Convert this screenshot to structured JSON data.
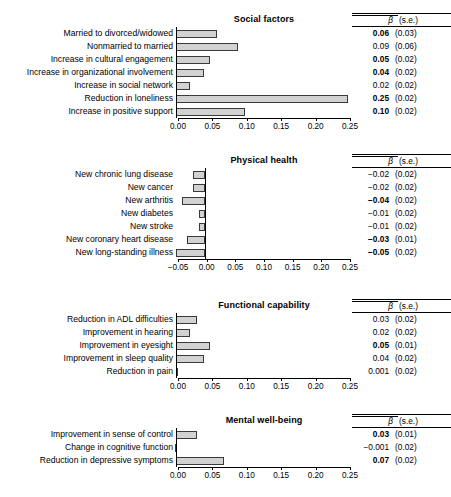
{
  "stats_header": {
    "beta": "β",
    "se": "(s.e.)"
  },
  "chart_data": {
    "type": "bar",
    "title": "",
    "xlabel": "",
    "ylabel": "",
    "grid": false,
    "orientation": "horizontal",
    "panels": [
      {
        "title": "Social factors",
        "xlim": [
          0.0,
          0.25
        ],
        "xticks": [
          0.0,
          0.05,
          0.1,
          0.15,
          0.2,
          0.25
        ],
        "xticklabels": [
          "0.00",
          "0.05",
          "0.10",
          "0.15",
          "0.20",
          "0.25"
        ],
        "categories": [
          "Married to divorced/widowed",
          "Nonmarried to married",
          "Increase in cultural engagement",
          "Increase in organizational involvement",
          "Increase in social network",
          "Reduction in loneliness",
          "Increase in positive support"
        ],
        "values": [
          0.06,
          0.09,
          0.05,
          0.04,
          0.02,
          0.25,
          0.1
        ],
        "beta": [
          "0.06",
          "0.09",
          "0.05",
          "0.04",
          "0.02",
          "0.25",
          "0.10"
        ],
        "beta_bold": [
          true,
          false,
          true,
          true,
          false,
          true,
          true
        ],
        "se": [
          "(0.03)",
          "(0.06)",
          "(0.02)",
          "(0.02)",
          "(0.02)",
          "(0.02)",
          "(0.02)"
        ]
      },
      {
        "title": "Physical health",
        "xlim": [
          -0.05,
          0.25
        ],
        "xticks": [
          -0.05,
          0.0,
          0.05,
          0.1,
          0.15,
          0.2,
          0.25
        ],
        "xticklabels": [
          "−0.05",
          "0.00",
          "0.05",
          "0.10",
          "0.15",
          "0.20",
          "0.25"
        ],
        "categories": [
          "New chronic lung disease",
          "New cancer",
          "New arthritis",
          "New diabetes",
          "New stroke",
          "New coronary heart disease",
          "New long-standing illness"
        ],
        "values": [
          -0.02,
          -0.02,
          -0.04,
          -0.01,
          -0.01,
          -0.03,
          -0.05
        ],
        "beta": [
          "−0.02",
          "−0.02",
          "−0.04",
          "−0.01",
          "−0.01",
          "−0.03",
          "−0.05"
        ],
        "beta_bold": [
          false,
          false,
          true,
          false,
          false,
          true,
          true
        ],
        "se": [
          "(0.02)",
          "(0.02)",
          "(0.02)",
          "(0.02)",
          "(0.02)",
          "(0.01)",
          "(0.02)"
        ]
      },
      {
        "title": "Functional capability",
        "xlim": [
          0.0,
          0.25
        ],
        "xticks": [
          0.0,
          0.05,
          0.1,
          0.15,
          0.2,
          0.25
        ],
        "xticklabels": [
          "0.00",
          "0.05",
          "0.10",
          "0.15",
          "0.20",
          "0.25"
        ],
        "categories": [
          "Reduction in ADL difficulties",
          "Improvement in hearing",
          "Improvement in eyesight",
          "Improvement in sleep quality",
          "Reduction in  pain"
        ],
        "values": [
          0.03,
          0.02,
          0.05,
          0.04,
          0.001
        ],
        "beta": [
          "0.03",
          "0.02",
          "0.05",
          "0.04",
          "0.001"
        ],
        "beta_bold": [
          false,
          false,
          true,
          false,
          false
        ],
        "se": [
          "(0.02)",
          "(0.02)",
          "(0.01)",
          "(0.02)",
          "(0.02)"
        ]
      },
      {
        "title": "Mental well-being",
        "xlim": [
          0.0,
          0.25
        ],
        "xticks": [
          0.0,
          0.05,
          0.1,
          0.15,
          0.2,
          0.25
        ],
        "xticklabels": [
          "0.00",
          "0.05",
          "0.10",
          "0.15",
          "0.20",
          "0.25"
        ],
        "categories": [
          "Improvement in sense of control",
          "Change in cognitive function",
          "Reduction in depressive symptoms"
        ],
        "values": [
          0.03,
          -0.001,
          0.07
        ],
        "beta": [
          "0.03",
          "−0.001",
          "0.07"
        ],
        "beta_bold": [
          true,
          false,
          true
        ],
        "se": [
          "(0.01)",
          "(0.02)",
          "(0.02)"
        ]
      }
    ]
  }
}
